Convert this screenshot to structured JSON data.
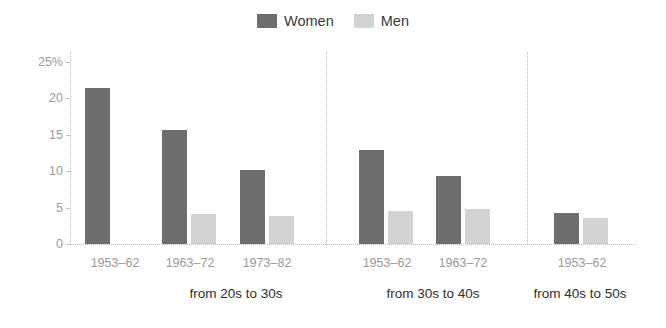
{
  "legend": {
    "entries": [
      {
        "label": "Women",
        "color": "#6e6e6e",
        "icon": "legend-swatch-women"
      },
      {
        "label": "Men",
        "color": "#d3d3d3",
        "icon": "legend-swatch-men"
      }
    ]
  },
  "axis": {
    "y_ticks": [
      "25%",
      "20",
      "15",
      "10",
      "5",
      "0"
    ],
    "y_tick_values": [
      25,
      20,
      15,
      10,
      5,
      0
    ]
  },
  "groups": [
    {
      "label": "from 20s to 30s",
      "categories": [
        "1953–62",
        "1963–72",
        "1973–82"
      ]
    },
    {
      "label": "from 30s to 40s",
      "categories": [
        "1953–62",
        "1963–72"
      ]
    },
    {
      "label": "from 40s to 50s",
      "categories": [
        "1953–62"
      ]
    }
  ],
  "chart_data": {
    "type": "bar",
    "title": "",
    "subtitle": "",
    "xlabel": "",
    "ylabel": "",
    "ylim": [
      0,
      25
    ],
    "y_unit": "%",
    "grid": false,
    "legend_position": "top-center",
    "group_labels": [
      "from 20s to 30s",
      "from 30s to 40s",
      "from 40s to 50s"
    ],
    "categories": [
      "from 20s to 30s / 1953–62",
      "from 20s to 30s / 1963–72",
      "from 20s to 30s / 1973–82",
      "from 30s to 40s / 1953–62",
      "from 30s to 40s / 1963–72",
      "from 40s to 50s / 1953–62"
    ],
    "series": [
      {
        "name": "Women",
        "color": "#6e6e6e",
        "values": [
          21.4,
          15.6,
          10.2,
          12.9,
          9.3,
          4.3
        ]
      },
      {
        "name": "Men",
        "color": "#d3d3d3",
        "values": [
          null,
          4.1,
          3.8,
          4.5,
          4.8,
          3.6
        ]
      }
    ]
  }
}
